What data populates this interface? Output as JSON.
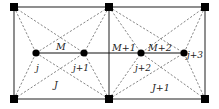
{
  "diagram": {
    "type": "mesh-cells",
    "colors": {
      "line": "#333333",
      "dashed": "#555555",
      "node": "#000000",
      "background": "#ffffff"
    },
    "corners": [
      {
        "id": "tl",
        "x": 14,
        "y": 7
      },
      {
        "id": "tm",
        "x": 109,
        "y": 7
      },
      {
        "id": "tr",
        "x": 205,
        "y": 7
      },
      {
        "id": "bl",
        "x": 14,
        "y": 99
      },
      {
        "id": "bm",
        "x": 109,
        "y": 99
      },
      {
        "id": "br",
        "x": 205,
        "y": 99
      }
    ],
    "nodes": [
      {
        "id": "j",
        "x": 36,
        "y": 53,
        "label": "j"
      },
      {
        "id": "j1",
        "x": 84,
        "y": 53,
        "label": "j+1"
      },
      {
        "id": "j2",
        "x": 141,
        "y": 53,
        "label": "j+2"
      },
      {
        "id": "j3",
        "x": 184,
        "y": 53,
        "label": "j+3"
      }
    ],
    "edge_labels": {
      "M": "M",
      "M1": "M+1",
      "M2": "M+2"
    },
    "cell_labels": {
      "J": "J",
      "J1": "J+1"
    }
  }
}
